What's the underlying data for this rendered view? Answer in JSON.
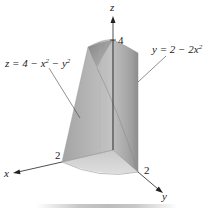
{
  "figure": {
    "type": "3D surface diagram",
    "axes": {
      "x": {
        "label": "x",
        "tick": "2"
      },
      "y": {
        "label": "y",
        "tick": "2"
      },
      "z": {
        "label": "z",
        "tick": "4"
      }
    },
    "annotations": [
      {
        "id": "paraboloid",
        "lhs": "z = 4 − x",
        "exp1": "2",
        "mid": " − y",
        "exp2": "2"
      },
      {
        "id": "cylinder",
        "lhs": "y = 2 − 2x",
        "exp1": "2"
      }
    ],
    "colors": {
      "surface_dark": "#8c8c8c",
      "surface_mid": "#a9a9a9",
      "surface_light": "#cfcfcf",
      "axis": "#222222"
    }
  }
}
